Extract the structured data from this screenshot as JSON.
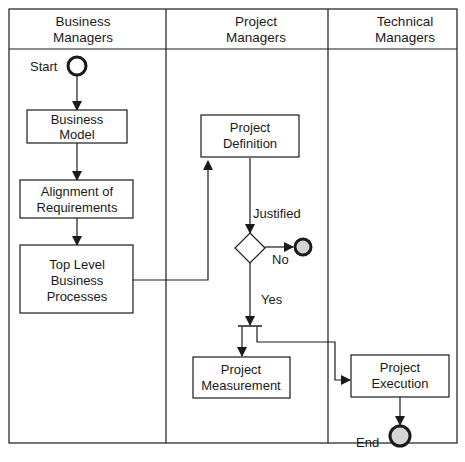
{
  "lanes": [
    {
      "line1": "Business",
      "line2": "Managers"
    },
    {
      "line1": "Project",
      "line2": "Managers"
    },
    {
      "line1": "Technical",
      "line2": "Managers"
    }
  ],
  "nodes": {
    "start": {
      "label": "Start"
    },
    "business_model": {
      "line1": "Business",
      "line2": "Model"
    },
    "alignment": {
      "line1": "Alignment of",
      "line2": "Requirements"
    },
    "top_level": {
      "line1": "Top Level",
      "line2": "Business",
      "line3": "Processes"
    },
    "project_definition": {
      "line1": "Project",
      "line2": "Definition"
    },
    "decision": {
      "in_label": "Justified",
      "no_label": "No",
      "yes_label": "Yes"
    },
    "project_measurement": {
      "line1": "Project",
      "line2": "Measurement"
    },
    "project_execution": {
      "line1": "Project",
      "line2": "Execution"
    },
    "end": {
      "label": "End"
    }
  },
  "colors": {
    "stroke": "#1a1a1a",
    "terminal_fill": "#d4d4d4",
    "background": "#ffffff"
  }
}
